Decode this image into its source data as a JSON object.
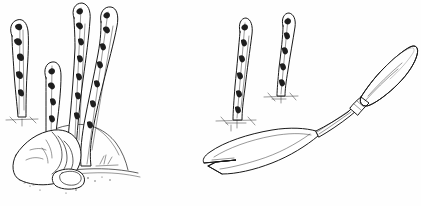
{
  "illustration": {
    "title": "Asparagus harvesting",
    "medium": "pen-and-ink line drawing",
    "palette": {
      "background": "#fefefe",
      "ink": "#1a1a1a",
      "shadow_gray": "#555555",
      "paper_white": "#ffffff"
    },
    "canvas": {
      "width": 421,
      "height": 206
    },
    "scenes": [
      {
        "id": "left-scene",
        "name": "hand-harvesting-asparagus",
        "description": "A hand reaching down to grasp an asparagus spear at ground level, surrounded by four emerging spears rising from a soil mound",
        "elements": [
          {
            "name": "spear-far-left",
            "label": "Asparagus spear"
          },
          {
            "name": "spear-short-center",
            "label": "Asparagus spear"
          },
          {
            "name": "spear-tall-left",
            "label": "Asparagus spear"
          },
          {
            "name": "spear-tall-right",
            "label": "Asparagus spear"
          },
          {
            "name": "harvesting-hand",
            "label": "Hand grasping spear"
          },
          {
            "name": "soil-mound",
            "label": "Soil mound"
          },
          {
            "name": "ground-line",
            "label": "Ground line"
          }
        ]
      },
      {
        "id": "right-scene",
        "name": "asparagus-knife-and-spears",
        "description": "Two upright asparagus spears growing from soil beside a long-handled asparagus harvesting knife with a V-notched blade",
        "elements": [
          {
            "name": "spear-right-near",
            "label": "Asparagus spear"
          },
          {
            "name": "spear-right-far",
            "label": "Asparagus spear"
          },
          {
            "name": "asparagus-knife",
            "label": "Asparagus harvesting knife"
          },
          {
            "name": "knife-handle",
            "label": "Wooden handle"
          },
          {
            "name": "knife-ferrule",
            "label": "Metal ferrule"
          },
          {
            "name": "knife-shaft",
            "label": "Long steel shaft"
          },
          {
            "name": "knife-blade",
            "label": "V-notched cutting blade"
          },
          {
            "name": "soil-marks",
            "label": "Soil hatching"
          }
        ]
      }
    ],
    "labels": []
  }
}
